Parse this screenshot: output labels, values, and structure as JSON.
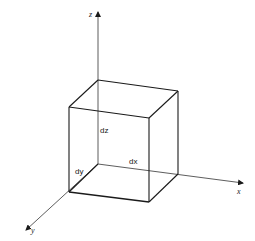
{
  "diagram": {
    "axes": {
      "x": {
        "label": "x"
      },
      "y": {
        "label": "y"
      },
      "z": {
        "label": "z"
      }
    },
    "dimensions": {
      "dx": "dx",
      "dy": "dy",
      "dz": "dz"
    },
    "colors": {
      "line": "#1a1a1a",
      "background": "#ffffff"
    }
  }
}
